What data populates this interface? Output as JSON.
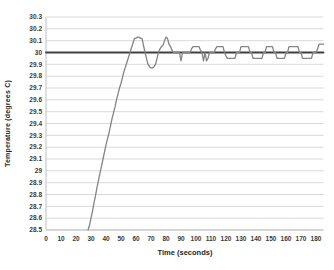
{
  "chart_data": {
    "type": "line",
    "title": "",
    "xlabel": "Time (seconds)",
    "ylabel": "Temperature (degrees C)",
    "xlim": [
      0,
      185
    ],
    "ylim": [
      28.5,
      30.3
    ],
    "grid": "horizontal",
    "legend": "none",
    "colors": {
      "background": "#ffffff",
      "grid": "#d9d9d9",
      "axis": "#bfbfbf",
      "tick_text": "#3a3a3a",
      "setpoint_line": "#3f3f3f",
      "data_line": "#848484"
    },
    "x_ticks": [
      {
        "v": 0,
        "label": "0"
      },
      {
        "v": 10,
        "label": "10"
      },
      {
        "v": 20,
        "label": "20"
      },
      {
        "v": 30,
        "label": "30"
      },
      {
        "v": 40,
        "label": "40"
      },
      {
        "v": 50,
        "label": "50"
      },
      {
        "v": 60,
        "label": "60"
      },
      {
        "v": 70,
        "label": "70"
      },
      {
        "v": 80,
        "label": "80"
      },
      {
        "v": 90,
        "label": "90"
      },
      {
        "v": 100,
        "label": "100"
      },
      {
        "v": 110,
        "label": "110"
      },
      {
        "v": 120,
        "label": "120"
      },
      {
        "v": 130,
        "label": "130"
      },
      {
        "v": 140,
        "label": "140"
      },
      {
        "v": 150,
        "label": "150"
      },
      {
        "v": 160,
        "label": "160"
      },
      {
        "v": 170,
        "label": "170"
      },
      {
        "v": 180,
        "label": "180"
      }
    ],
    "y_ticks": [
      {
        "v": 30.3,
        "label": "30.3"
      },
      {
        "v": 30.2,
        "label": "30.2"
      },
      {
        "v": 30.1,
        "label": "30.1"
      },
      {
        "v": 30.0,
        "label": "30"
      },
      {
        "v": 29.9,
        "label": "29.9"
      },
      {
        "v": 29.8,
        "label": "29.8"
      },
      {
        "v": 29.7,
        "label": "29.7"
      },
      {
        "v": 29.6,
        "label": "29.6"
      },
      {
        "v": 29.5,
        "label": "29.5"
      },
      {
        "v": 29.4,
        "label": "29.4"
      },
      {
        "v": 29.3,
        "label": "29.3"
      },
      {
        "v": 29.2,
        "label": "29.2"
      },
      {
        "v": 29.1,
        "label": "29.1"
      },
      {
        "v": 29.0,
        "label": "29"
      },
      {
        "v": 28.9,
        "label": "28.9"
      },
      {
        "v": 28.8,
        "label": "28.8"
      },
      {
        "v": 28.7,
        "label": "28.7"
      },
      {
        "v": 28.6,
        "label": "28.6"
      },
      {
        "v": 28.5,
        "label": "28.5"
      }
    ],
    "series": [
      {
        "name": "setpoint-30C",
        "color": "#3f3f3f",
        "width": 1.8,
        "points": [
          [
            0,
            30
          ],
          [
            185,
            30
          ]
        ]
      },
      {
        "name": "measured-temperature",
        "color": "#848484",
        "width": 1.3,
        "points": [
          [
            28,
            28.5
          ],
          [
            29,
            28.54
          ],
          [
            30,
            28.6
          ],
          [
            31,
            28.66
          ],
          [
            32,
            28.73
          ],
          [
            33,
            28.79
          ],
          [
            34,
            28.86
          ],
          [
            35,
            28.92
          ],
          [
            36,
            28.98
          ],
          [
            37,
            29.04
          ],
          [
            38,
            29.1
          ],
          [
            39,
            29.16
          ],
          [
            40,
            29.22
          ],
          [
            41,
            29.27
          ],
          [
            42,
            29.32
          ],
          [
            43,
            29.38
          ],
          [
            44,
            29.44
          ],
          [
            45,
            29.49
          ],
          [
            46,
            29.54
          ],
          [
            47,
            29.6
          ],
          [
            48,
            29.65
          ],
          [
            49,
            29.7
          ],
          [
            50,
            29.74
          ],
          [
            51,
            29.79
          ],
          [
            52,
            29.84
          ],
          [
            53,
            29.88
          ],
          [
            54,
            29.92
          ],
          [
            55,
            29.96
          ],
          [
            56,
            30
          ],
          [
            57,
            30.04
          ],
          [
            58,
            30.08
          ],
          [
            59,
            30.12
          ],
          [
            60,
            30.12
          ],
          [
            61,
            30.13
          ],
          [
            62,
            30.13
          ],
          [
            63,
            30.12
          ],
          [
            64,
            30.12
          ],
          [
            65,
            30.06
          ],
          [
            66,
            30
          ],
          [
            67,
            29.95
          ],
          [
            68,
            29.9
          ],
          [
            69,
            29.88
          ],
          [
            70,
            29.87
          ],
          [
            71,
            29.87
          ],
          [
            72,
            29.88
          ],
          [
            73,
            29.9
          ],
          [
            74,
            29.95
          ],
          [
            75,
            30
          ],
          [
            76,
            30.03
          ],
          [
            77,
            30.05
          ],
          [
            78,
            30.06
          ],
          [
            79,
            30.1
          ],
          [
            80,
            30.13
          ],
          [
            81,
            30.12
          ],
          [
            82,
            30.07
          ],
          [
            83,
            30.05
          ],
          [
            84,
            30.02
          ],
          [
            85,
            30
          ],
          [
            86,
            30
          ],
          [
            87,
            30
          ],
          [
            88,
            30
          ],
          [
            89,
            30
          ],
          [
            90,
            29.93
          ],
          [
            91,
            30
          ],
          [
            92,
            30
          ],
          [
            93,
            30
          ],
          [
            94,
            30
          ],
          [
            95,
            30
          ],
          [
            96,
            30
          ],
          [
            97,
            30.03
          ],
          [
            98,
            30.05
          ],
          [
            99,
            30.05
          ],
          [
            100,
            30.05
          ],
          [
            101,
            30.05
          ],
          [
            102,
            30.05
          ],
          [
            103,
            30.02
          ],
          [
            104,
            30
          ],
          [
            105,
            29.93
          ],
          [
            106,
            30
          ],
          [
            107,
            29.93
          ],
          [
            108,
            29.95
          ],
          [
            109,
            30
          ],
          [
            110,
            30
          ],
          [
            111,
            30
          ],
          [
            112,
            30
          ],
          [
            113,
            30.03
          ],
          [
            114,
            30.05
          ],
          [
            115,
            30.05
          ],
          [
            116,
            30.05
          ],
          [
            117,
            30.05
          ],
          [
            118,
            30.05
          ],
          [
            119,
            30
          ],
          [
            120,
            29.97
          ],
          [
            121,
            29.95
          ],
          [
            122,
            29.95
          ],
          [
            123,
            29.95
          ],
          [
            124,
            29.95
          ],
          [
            125,
            29.95
          ],
          [
            126,
            29.95
          ],
          [
            127,
            30
          ],
          [
            128,
            30
          ],
          [
            129,
            30
          ],
          [
            130,
            30.05
          ],
          [
            131,
            30.05
          ],
          [
            132,
            30.05
          ],
          [
            133,
            30.05
          ],
          [
            134,
            30.05
          ],
          [
            135,
            30.05
          ],
          [
            136,
            30
          ],
          [
            137,
            30
          ],
          [
            138,
            29.95
          ],
          [
            139,
            29.95
          ],
          [
            140,
            29.95
          ],
          [
            141,
            29.95
          ],
          [
            142,
            29.95
          ],
          [
            143,
            29.95
          ],
          [
            144,
            29.95
          ],
          [
            145,
            30
          ],
          [
            146,
            30
          ],
          [
            147,
            30.05
          ],
          [
            148,
            30.05
          ],
          [
            149,
            30.05
          ],
          [
            150,
            30.05
          ],
          [
            151,
            30.05
          ],
          [
            152,
            30
          ],
          [
            153,
            30
          ],
          [
            154,
            29.95
          ],
          [
            155,
            29.95
          ],
          [
            156,
            29.95
          ],
          [
            157,
            29.95
          ],
          [
            158,
            29.95
          ],
          [
            159,
            29.95
          ],
          [
            160,
            30
          ],
          [
            161,
            30
          ],
          [
            162,
            30.05
          ],
          [
            163,
            30.05
          ],
          [
            164,
            30.05
          ],
          [
            165,
            30.05
          ],
          [
            166,
            30.05
          ],
          [
            167,
            30.05
          ],
          [
            168,
            30.05
          ],
          [
            169,
            30
          ],
          [
            170,
            30
          ],
          [
            171,
            29.95
          ],
          [
            172,
            29.95
          ],
          [
            173,
            29.95
          ],
          [
            174,
            29.95
          ],
          [
            175,
            29.95
          ],
          [
            176,
            29.95
          ],
          [
            177,
            29.95
          ],
          [
            178,
            30
          ],
          [
            179,
            30
          ],
          [
            180,
            30
          ],
          [
            181,
            30.03
          ],
          [
            182,
            30.07
          ],
          [
            183,
            30.07
          ],
          [
            184,
            30.07
          ],
          [
            185,
            30.07
          ]
        ]
      }
    ],
    "plot_area": {
      "left": 46,
      "right": 323.5,
      "top": 17,
      "bottom": 230
    }
  }
}
